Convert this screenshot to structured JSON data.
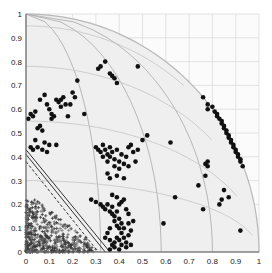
{
  "chart_data": {
    "type": "scatter",
    "title": "",
    "xlabel": "",
    "ylabel": "",
    "xlim": [
      0,
      1
    ],
    "ylim": [
      0,
      1
    ],
    "grid": true,
    "legend": null,
    "x_ticks": [
      "0",
      "0.1",
      "0.2",
      "0.3",
      "0.4",
      "0.5",
      "0.6",
      "0.7",
      "0.8",
      "0.9",
      "1"
    ],
    "y_ticks": [
      "0",
      "0.1",
      "0.2",
      "0.3",
      "0.4",
      "0.5",
      "0.6",
      "0.7",
      "0.8",
      "0.9",
      "1"
    ],
    "overlay": {
      "quarter_circle_radius": 1,
      "spherical_grid": true,
      "diagonal_lines": [
        {
          "from": [
            0,
            0.43
          ],
          "to": [
            0.36,
            0.0
          ]
        },
        {
          "from": [
            0,
            0.41
          ],
          "to": [
            0.34,
            0.0
          ]
        },
        {
          "from": [
            0,
            0.38
          ],
          "to": [
            0.31,
            0.0
          ]
        }
      ]
    },
    "series": [
      {
        "name": "dots",
        "marker": "filled-circle",
        "color": "#111111",
        "points": [
          [
            0.01,
            0.56
          ],
          [
            0.02,
            0.58
          ],
          [
            0.03,
            0.57
          ],
          [
            0.04,
            0.59
          ],
          [
            0.05,
            0.52
          ],
          [
            0.06,
            0.53
          ],
          [
            0.07,
            0.51
          ],
          [
            0.06,
            0.64
          ],
          [
            0.08,
            0.66
          ],
          [
            0.09,
            0.62
          ],
          [
            0.1,
            0.6
          ],
          [
            0.11,
            0.58
          ],
          [
            0.12,
            0.57
          ],
          [
            0.11,
            0.56
          ],
          [
            0.13,
            0.64
          ],
          [
            0.14,
            0.63
          ],
          [
            0.15,
            0.64
          ],
          [
            0.16,
            0.65
          ],
          [
            0.15,
            0.61
          ],
          [
            0.17,
            0.62
          ],
          [
            0.18,
            0.57
          ],
          [
            0.19,
            0.62
          ],
          [
            0.2,
            0.67
          ],
          [
            0.21,
            0.65
          ],
          [
            0.22,
            0.72
          ],
          [
            0.25,
            0.58
          ],
          [
            0.04,
            0.47
          ],
          [
            0.05,
            0.44
          ],
          [
            0.08,
            0.46
          ],
          [
            0.1,
            0.45
          ],
          [
            0.13,
            0.45
          ],
          [
            0.07,
            0.43
          ],
          [
            0.09,
            0.42
          ],
          [
            0.03,
            0.43
          ],
          [
            0.02,
            0.44
          ],
          [
            0.31,
            0.77
          ],
          [
            0.32,
            0.78
          ],
          [
            0.34,
            0.8
          ],
          [
            0.36,
            0.75
          ],
          [
            0.37,
            0.74
          ],
          [
            0.38,
            0.73
          ],
          [
            0.39,
            0.71
          ],
          [
            0.48,
            0.78
          ],
          [
            0.3,
            0.44
          ],
          [
            0.31,
            0.43
          ],
          [
            0.32,
            0.42
          ],
          [
            0.33,
            0.45
          ],
          [
            0.33,
            0.4
          ],
          [
            0.34,
            0.43
          ],
          [
            0.35,
            0.41
          ],
          [
            0.35,
            0.38
          ],
          [
            0.36,
            0.44
          ],
          [
            0.36,
            0.4
          ],
          [
            0.37,
            0.42
          ],
          [
            0.38,
            0.39
          ],
          [
            0.38,
            0.36
          ],
          [
            0.39,
            0.43
          ],
          [
            0.4,
            0.38
          ],
          [
            0.4,
            0.35
          ],
          [
            0.41,
            0.41
          ],
          [
            0.42,
            0.37
          ],
          [
            0.43,
            0.4
          ],
          [
            0.44,
            0.36
          ],
          [
            0.44,
            0.44
          ],
          [
            0.45,
            0.45
          ],
          [
            0.46,
            0.42
          ],
          [
            0.47,
            0.38
          ],
          [
            0.35,
            0.33
          ],
          [
            0.36,
            0.31
          ],
          [
            0.39,
            0.32
          ],
          [
            0.42,
            0.31
          ],
          [
            0.48,
            0.43
          ],
          [
            0.5,
            0.47
          ],
          [
            0.52,
            0.49
          ],
          [
            0.28,
            0.22
          ],
          [
            0.3,
            0.21
          ],
          [
            0.32,
            0.2
          ],
          [
            0.33,
            0.19
          ],
          [
            0.34,
            0.18
          ],
          [
            0.35,
            0.2
          ],
          [
            0.36,
            0.17
          ],
          [
            0.37,
            0.16
          ],
          [
            0.37,
            0.19
          ],
          [
            0.38,
            0.15
          ],
          [
            0.38,
            0.13
          ],
          [
            0.39,
            0.17
          ],
          [
            0.39,
            0.11
          ],
          [
            0.4,
            0.14
          ],
          [
            0.4,
            0.1
          ],
          [
            0.41,
            0.12
          ],
          [
            0.41,
            0.08
          ],
          [
            0.42,
            0.1
          ],
          [
            0.36,
            0.1
          ],
          [
            0.35,
            0.08
          ],
          [
            0.34,
            0.06
          ],
          [
            0.36,
            0.05
          ],
          [
            0.37,
            0.03
          ],
          [
            0.38,
            0.04
          ],
          [
            0.39,
            0.06
          ],
          [
            0.4,
            0.05
          ],
          [
            0.41,
            0.03
          ],
          [
            0.42,
            0.06
          ],
          [
            0.43,
            0.04
          ],
          [
            0.44,
            0.07
          ],
          [
            0.45,
            0.09
          ],
          [
            0.44,
            0.12
          ],
          [
            0.46,
            0.13
          ],
          [
            0.45,
            0.03
          ],
          [
            0.43,
            0.02
          ],
          [
            0.38,
            0.02
          ],
          [
            0.36,
            0.01
          ],
          [
            0.4,
            0.01
          ],
          [
            0.37,
            0.24
          ],
          [
            0.39,
            0.23
          ],
          [
            0.41,
            0.21
          ],
          [
            0.43,
            0.18
          ],
          [
            0.44,
            0.16
          ],
          [
            0.42,
            0.22
          ],
          [
            0.4,
            0.2
          ],
          [
            0.62,
            0.46
          ],
          [
            0.59,
            0.12
          ],
          [
            0.64,
            0.23
          ],
          [
            0.74,
            0.28
          ],
          [
            0.76,
            0.18
          ],
          [
            0.77,
            0.32
          ],
          [
            0.77,
            0.37
          ],
          [
            0.78,
            0.36
          ],
          [
            0.78,
            0.38
          ],
          [
            0.83,
            0.2
          ],
          [
            0.84,
            0.22
          ],
          [
            0.85,
            0.26
          ],
          [
            0.87,
            0.23
          ],
          [
            0.92,
            0.09
          ],
          [
            0.76,
            0.65
          ],
          [
            0.78,
            0.62
          ],
          [
            0.78,
            0.6
          ],
          [
            0.8,
            0.61
          ],
          [
            0.81,
            0.59
          ],
          [
            0.82,
            0.58
          ],
          [
            0.82,
            0.57
          ],
          [
            0.83,
            0.56
          ],
          [
            0.84,
            0.55
          ],
          [
            0.84,
            0.54
          ],
          [
            0.85,
            0.53
          ],
          [
            0.85,
            0.52
          ],
          [
            0.86,
            0.51
          ],
          [
            0.86,
            0.5
          ],
          [
            0.87,
            0.49
          ],
          [
            0.87,
            0.48
          ],
          [
            0.88,
            0.47
          ],
          [
            0.88,
            0.46
          ],
          [
            0.89,
            0.45
          ],
          [
            0.89,
            0.44
          ],
          [
            0.9,
            0.43
          ],
          [
            0.9,
            0.42
          ],
          [
            0.91,
            0.41
          ],
          [
            0.91,
            0.4
          ],
          [
            0.92,
            0.39
          ],
          [
            0.92,
            0.38
          ],
          [
            0.93,
            0.36
          ]
        ]
      },
      {
        "name": "crosses",
        "marker": "plus",
        "color": "#555555",
        "note": "dense cloud of ~several hundred points concentrated in x 0–0.3, y 0–0.22, densest near origin",
        "region": {
          "x": [
            0,
            0.32
          ],
          "y": [
            0,
            0.22
          ]
        }
      }
    ]
  }
}
